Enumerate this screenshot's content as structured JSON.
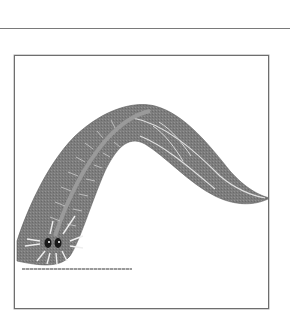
{
  "figure": {
    "style": "grayscale",
    "colors": {
      "body": "#7d7d7d",
      "body_dark": "#6a6a6a",
      "markings": "#e8e8e8",
      "frame": "#6e6e6e",
      "rule": "#7a7a7a"
    }
  }
}
